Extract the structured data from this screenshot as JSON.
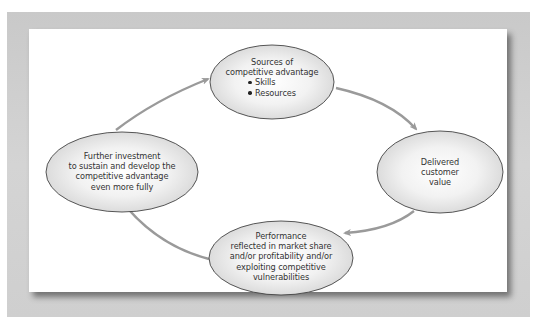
{
  "diagram": {
    "type": "cycle",
    "colors": {
      "frame": "#cccccc",
      "panel": "#ffffff",
      "ellipse_stroke": "#444444",
      "ellipse_fill_center": "#ffffff",
      "ellipse_fill_edge": "#d8d8d8",
      "arrow": "#9a9a9a",
      "text": "#333333"
    },
    "nodes": [
      {
        "id": "sources",
        "title_line1": "Sources of",
        "title_line2": "competitive advantage",
        "bullets": [
          "Skills",
          "Resources"
        ]
      },
      {
        "id": "delivered",
        "line1": "Delivered",
        "line2": "customer",
        "line3": "value"
      },
      {
        "id": "performance",
        "line1": "Performance",
        "line2": "reflected in market share",
        "line3": "and/or profitability and/or",
        "line4": "exploiting competitive",
        "line5": "vulnerabilities"
      },
      {
        "id": "investment",
        "line1": "Further investment",
        "line2": "to sustain and develop the",
        "line3": "competitive advantage",
        "line4": "even more fully"
      }
    ],
    "edges": [
      {
        "from": "sources",
        "to": "delivered"
      },
      {
        "from": "delivered",
        "to": "performance"
      },
      {
        "from": "performance",
        "to": "investment"
      },
      {
        "from": "investment",
        "to": "sources"
      }
    ]
  }
}
